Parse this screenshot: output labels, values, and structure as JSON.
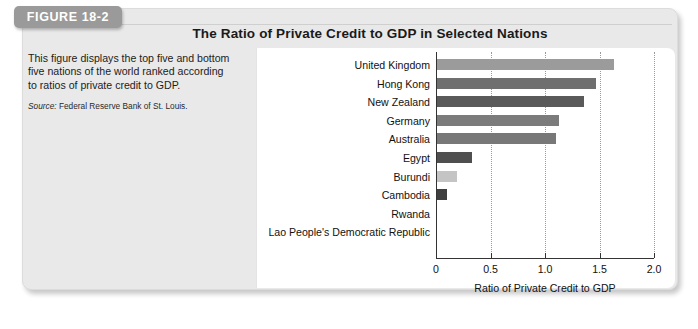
{
  "figure": {
    "badge_label": "FIGURE 18-2",
    "title": "The Ratio of Private Credit to GDP in Selected Nations",
    "caption": "This figure displays the top five and bottom five nations of the world ranked according to ratios of private credit to GDP.",
    "source_prefix": "Source:",
    "source_text": "Federal Reserve Bank of St. Louis."
  },
  "chart_data": {
    "type": "bar",
    "orientation": "horizontal",
    "title": "The Ratio of Private Credit to GDP in Selected Nations",
    "xlabel": "Ratio of Private Credit to GDP",
    "ylabel": "",
    "xlim": [
      0,
      2.0
    ],
    "xticks": [
      0,
      0.5,
      1.0,
      1.5,
      2.0
    ],
    "xtick_labels": [
      "0",
      "0.5",
      "1.0",
      "1.5",
      "2.0"
    ],
    "grid": "vertical-dotted",
    "legend": "none",
    "categories": [
      "United Kingdom",
      "Hong Kong",
      "New Zealand",
      "Germany",
      "Australia",
      "Egypt",
      "Burundi",
      "Cambodia",
      "Rwanda",
      "Lao People's Democratic Republic"
    ],
    "values": [
      1.63,
      1.47,
      1.36,
      1.13,
      1.1,
      0.33,
      0.19,
      0.1,
      0.0,
      0.0
    ],
    "bar_colors": [
      "#9b9b9b",
      "#6f6f6f",
      "#5a5a5a",
      "#7b7b7b",
      "#787878",
      "#4f4f4f",
      "#c4c4c4",
      "#3f3f3f",
      "#8a8a8a",
      "#8a8a8a"
    ]
  },
  "colors": {
    "panel_background": "#e9e9e9",
    "card_background": "#ffffff",
    "badge_background": "#9a9a9a",
    "axis": "#333333",
    "grid": "#9a9a9a",
    "text": "#111111"
  }
}
